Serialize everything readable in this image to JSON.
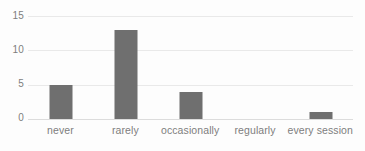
{
  "chart_data": {
    "type": "bar",
    "title": "",
    "subtitle": "",
    "xlabel": "",
    "ylabel": "",
    "categories": [
      "never",
      "rarely",
      "occasionally",
      "regularly",
      "every session"
    ],
    "values": [
      5,
      13,
      4,
      0,
      1
    ],
    "ylim": [
      0,
      15
    ],
    "yticks": [
      0,
      5,
      10,
      15
    ],
    "ytick_labels": [
      "0",
      "5",
      "10",
      "15"
    ],
    "grid": true,
    "legend": false,
    "legend_position": "none",
    "orientation": "vertical",
    "series": [
      {
        "name": "",
        "values": [
          5,
          13,
          4,
          0,
          1
        ]
      }
    ],
    "colors": {
      "bar": "#6f6f6f",
      "gridline": "#e9e9e9",
      "axis": "#dcdcdc",
      "tick_label": "#7d7d7d",
      "background": "#fdfdfd"
    }
  }
}
